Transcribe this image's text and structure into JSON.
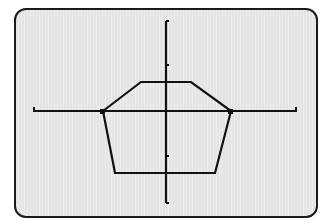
{
  "screen": {
    "background": "#e8e8e8",
    "border_color": "#1a1a1a",
    "ink_color": "#111111"
  },
  "chart_data": {
    "type": "line",
    "title": "",
    "xlabel": "",
    "ylabel": "",
    "grid": false,
    "legend": null,
    "axes": {
      "origin_px": [
        166,
        111
      ],
      "x_axis_px": {
        "from": 34,
        "to": 296,
        "y": 111
      },
      "y_axis_px": {
        "from": 21,
        "to": 203,
        "x": 166
      },
      "y_ticks_px": [
        21,
        65,
        156,
        203
      ],
      "x_ticks_px": [
        34,
        296
      ],
      "y_unit_px": 45.5
    },
    "series": [
      {
        "name": "polygon",
        "closed": true,
        "points_px": [
          [
            103,
            111
          ],
          [
            141,
            82
          ],
          [
            191,
            82
          ],
          [
            231,
            111
          ],
          [
            215,
            173
          ],
          [
            115,
            173
          ]
        ],
        "points_units_approx": [
          [
            -1.37,
            0
          ],
          [
            -0.55,
            0.64
          ],
          [
            0.55,
            0.64
          ],
          [
            1.43,
            0
          ],
          [
            1.08,
            -1.36
          ],
          [
            -1.12,
            -1.36
          ]
        ]
      }
    ],
    "ylim": [
      -2,
      2
    ]
  }
}
